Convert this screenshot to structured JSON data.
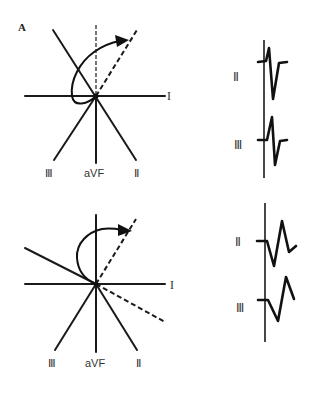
{
  "figure": {
    "panel_label": "A",
    "top_diagram": {
      "axis_labels": {
        "I": "I",
        "III": "Ⅲ",
        "aVF": "aVF",
        "II": "Ⅱ"
      },
      "description": "Hexaxial lead diagram with counterclockwise activation loop; leads I, II, III, aVF"
    },
    "bottom_diagram": {
      "axis_labels": {
        "I": "I",
        "III": "Ⅲ",
        "aVF": "aVF",
        "II": "Ⅱ"
      },
      "description": "Hexaxial lead diagram with clockwise activation loop rotated leftward"
    },
    "top_ecg": {
      "leads": [
        {
          "label": "Ⅱ"
        },
        {
          "label": "Ⅲ"
        }
      ]
    },
    "bottom_ecg": {
      "leads": [
        {
          "label": "Ⅱ"
        },
        {
          "label": "Ⅲ"
        }
      ]
    }
  }
}
